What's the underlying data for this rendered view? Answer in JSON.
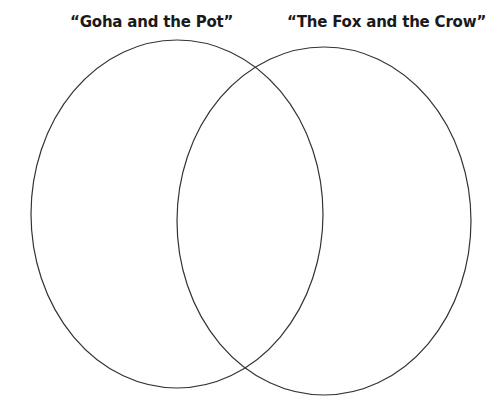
{
  "diagram": {
    "type": "venn",
    "sets": [
      {
        "label": "“Goha and the Pot”",
        "ellipse": {
          "cx": 177,
          "cy": 214,
          "rx": 146,
          "ry": 174
        }
      },
      {
        "label": "“The Fox and the Crow”",
        "ellipse": {
          "cx": 324,
          "cy": 221,
          "rx": 147,
          "ry": 174
        }
      }
    ],
    "stroke_color": "#333333",
    "background": "#ffffff"
  }
}
